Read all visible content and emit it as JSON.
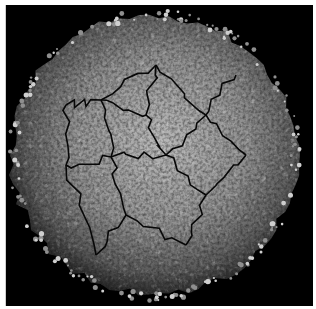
{
  "image": {
    "subject": "textured spherical particle micrograph",
    "description": "Grayscale rendering of a roughly spherical particle with a bumpy, ridged surface divided by dark crack-like lines, on a black background",
    "colors": {
      "background": "#000000",
      "border": "#ffffff",
      "surface_light": "#bdbdbd",
      "surface_mid": "#8a8a8a",
      "surface_dark": "#4a4a4a",
      "cracks": "#0a0a0a"
    }
  }
}
